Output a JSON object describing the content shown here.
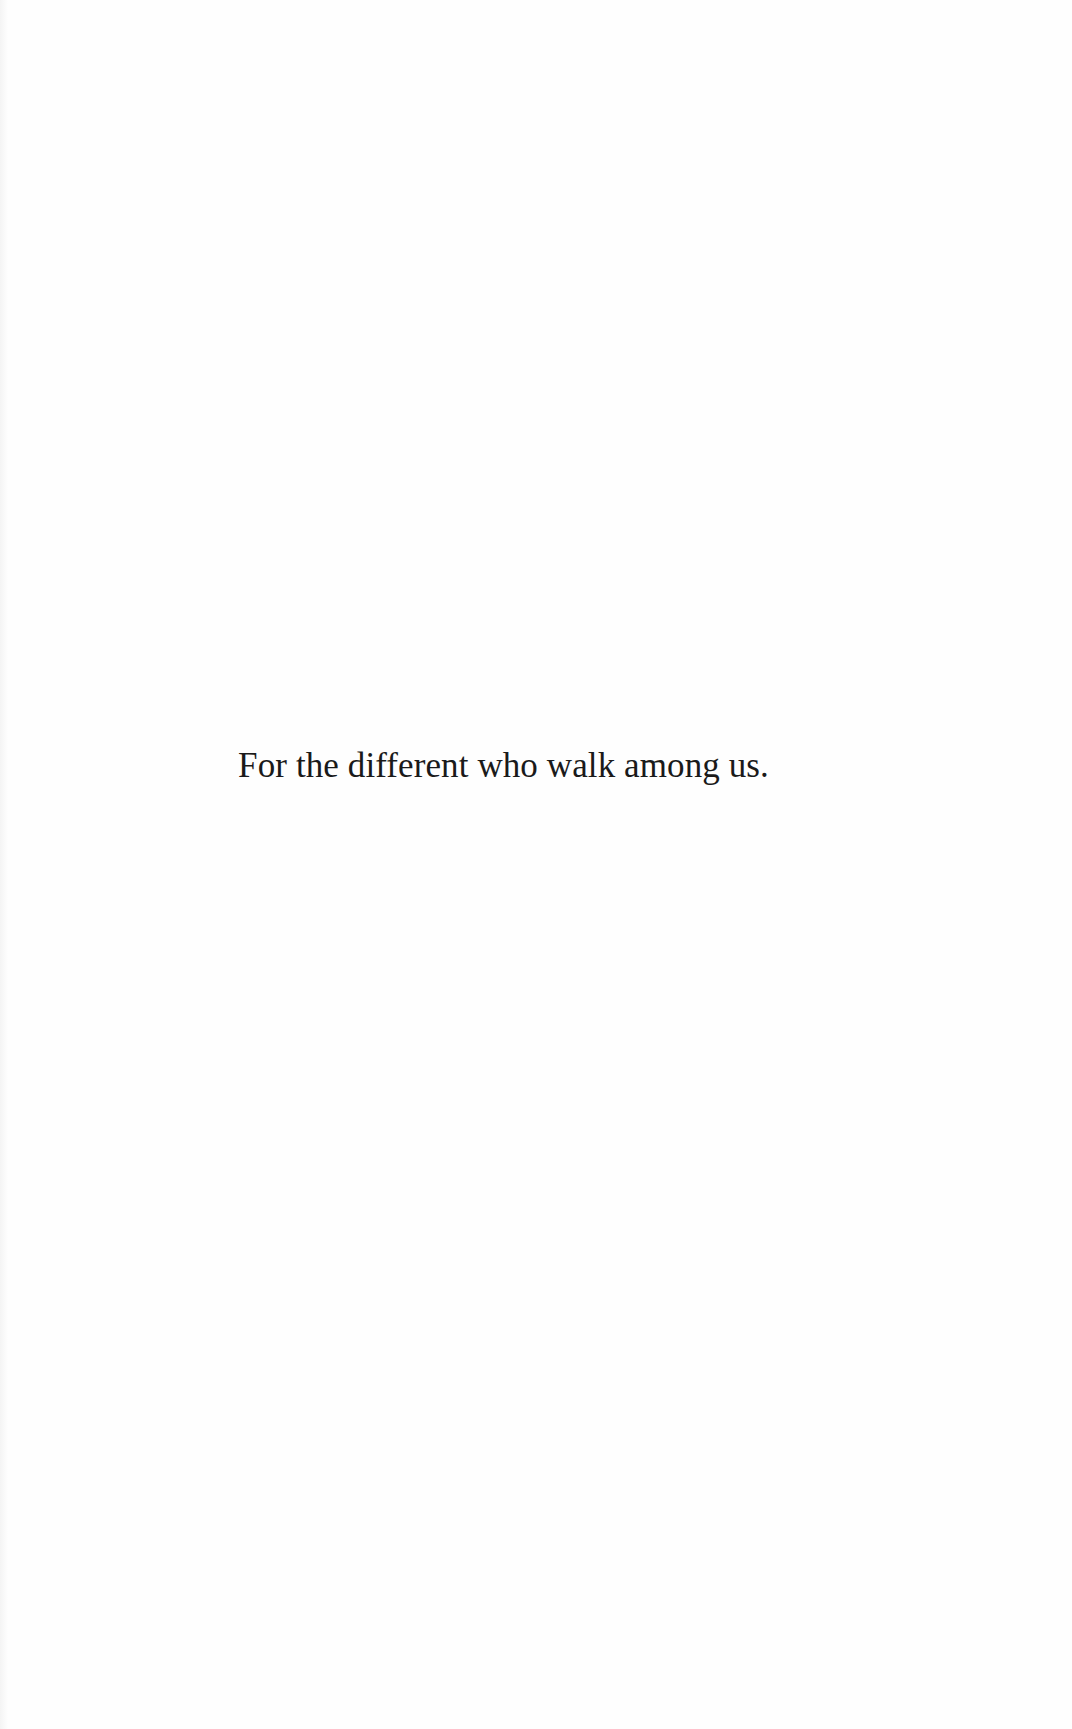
{
  "page": {
    "type": "dedication-page",
    "background_color": "#fefefe",
    "text_color": "#1a1a1a"
  },
  "dedication": {
    "text": "For the different who walk among us."
  }
}
